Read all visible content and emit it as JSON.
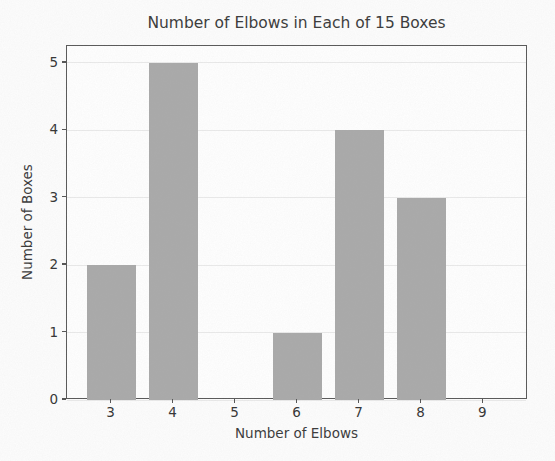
{
  "figure": {
    "background": "#fdfdfd"
  },
  "chart_data": {
    "type": "bar",
    "title": "Number of Elbows in Each of 15 Boxes",
    "xlabel": "Number of Elbows",
    "ylabel": "Number of Boxes",
    "categories": [
      3,
      4,
      5,
      6,
      7,
      8,
      9
    ],
    "values": [
      2,
      5,
      0,
      1,
      4,
      3,
      0
    ],
    "x_tick_labels": [
      "3",
      "4",
      "5",
      "6",
      "7",
      "8",
      "9"
    ],
    "y_tick_values": [
      0,
      1,
      2,
      3,
      4,
      5
    ],
    "y_tick_labels": [
      "0",
      "1",
      "2",
      "3",
      "4",
      "5"
    ],
    "xlim": [
      2.28,
      9.72
    ],
    "ylim": [
      0,
      5.25
    ],
    "bar_width": 0.8,
    "grid": "horizontal",
    "legend": "none",
    "colors": {
      "bar_fill": "#a9a9a9",
      "grid_line": "#eaeaea",
      "spine": "#575757",
      "tick": "#575757",
      "text": "#383838",
      "plot_background": "#ffffff"
    }
  }
}
